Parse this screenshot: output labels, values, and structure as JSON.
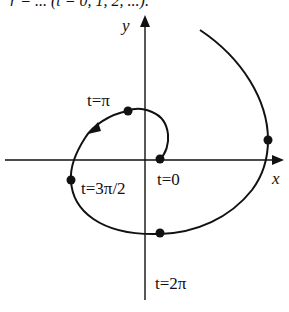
{
  "top_text": "r = ... (t = 0, 1, 2, ...).",
  "axes": {
    "x_label": "x",
    "y_label": "y"
  },
  "points": [
    {
      "label": "t=0",
      "desc": "start of spiral"
    },
    {
      "label": "t=π",
      "desc": "upper left"
    },
    {
      "label": "t=3π/2",
      "desc": "left"
    },
    {
      "label": "t=2π",
      "desc": "bottom"
    }
  ],
  "labels": {
    "t0": "t=0",
    "tpi": "t=π",
    "t3pi2": "t=3π/2",
    "t2pi": "t=2π"
  },
  "colors": {
    "stroke": "#111111",
    "background": "#ffffff"
  }
}
